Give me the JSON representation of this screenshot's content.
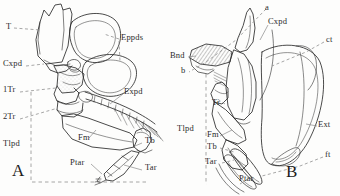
{
  "plate": {
    "title": "Comparative anatomy of insect thorax and leg, figures A and B",
    "background_color": "#fdfdfc",
    "ink_color": "#2b2b2b",
    "stipple_color": "#6f6f6f",
    "guide_color": "#8a8a8a",
    "width": 340,
    "height": 196
  },
  "figures": [
    {
      "key": "A",
      "letter": "A",
      "caption_position": {
        "x": 14,
        "y": 168
      },
      "labels": [
        {
          "id": "t",
          "text": "T",
          "x": 6,
          "y": 26,
          "leader": "dashed"
        },
        {
          "id": "cxpd",
          "text": "Cxpd",
          "x": 3,
          "y": 63,
          "leader": "dashed"
        },
        {
          "id": "1tr",
          "text": "1Tr",
          "x": 3,
          "y": 89,
          "leader": "dashed"
        },
        {
          "id": "2tr",
          "text": "2Tr",
          "x": 3,
          "y": 116,
          "leader": "dashed"
        },
        {
          "id": "tlpd",
          "text": "Tlpd",
          "x": 3,
          "y": 143,
          "leader": "none"
        },
        {
          "id": "eppds",
          "text": "Eppds",
          "x": 121,
          "y": 35,
          "leader": "dashed"
        },
        {
          "id": "expd",
          "text": "Expd",
          "x": 124,
          "y": 90,
          "leader": "solid"
        },
        {
          "id": "fm",
          "text": "Fm",
          "x": 78,
          "y": 140,
          "leader": "solid"
        },
        {
          "id": "tb",
          "text": "Tb",
          "x": 143,
          "y": 140,
          "leader": "solid"
        },
        {
          "id": "ptar",
          "text": "Ptar",
          "x": 73,
          "y": 162,
          "leader": "solid"
        },
        {
          "id": "tar",
          "text": "Tar",
          "x": 143,
          "y": 167,
          "leader": "solid"
        }
      ]
    },
    {
      "key": "B",
      "letter": "B",
      "caption_position": {
        "x": 288,
        "y": 167
      },
      "labels": [
        {
          "id": "a",
          "text": "a",
          "x": 267,
          "y": 5,
          "leader": "dashed"
        },
        {
          "id": "cxpd",
          "text": "Cxpd",
          "x": 268,
          "y": 20,
          "leader": "solid"
        },
        {
          "id": "ct",
          "text": "ct",
          "x": 326,
          "y": 38,
          "leader": "dashed"
        },
        {
          "id": "bnd",
          "text": "Bnd",
          "x": 172,
          "y": 54,
          "leader": "solid"
        },
        {
          "id": "b",
          "text": "b",
          "x": 182,
          "y": 69,
          "leader": "dashed"
        },
        {
          "id": "tr",
          "text": "Tr",
          "x": 214,
          "y": 101,
          "leader": "dashed"
        },
        {
          "id": "tlpd",
          "text": "Tlpd",
          "x": 178,
          "y": 127,
          "leader": "none"
        },
        {
          "id": "fm",
          "text": "Fm",
          "x": 208,
          "y": 133,
          "leader": "solid"
        },
        {
          "id": "tb",
          "text": "Tb",
          "x": 208,
          "y": 146,
          "leader": "dashed"
        },
        {
          "id": "ext",
          "text": "Ext",
          "x": 318,
          "y": 123,
          "leader": "solid"
        },
        {
          "id": "tar",
          "text": "Tar",
          "x": 207,
          "y": 161,
          "leader": "dashed"
        },
        {
          "id": "ft",
          "text": "ft",
          "x": 325,
          "y": 153,
          "leader": "dashed"
        },
        {
          "id": "ptar",
          "text": "Ptar",
          "x": 240,
          "y": 177,
          "leader": "solid"
        }
      ]
    }
  ]
}
